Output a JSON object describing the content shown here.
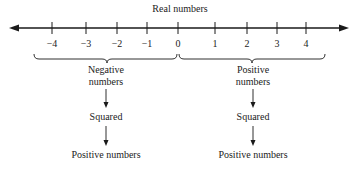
{
  "title": "Real numbers",
  "number_line": {
    "ticks": [
      "-4",
      "-3",
      "-2",
      "-1",
      "0",
      "1",
      "2",
      "3",
      "4"
    ],
    "tick_display": [
      "−4",
      "−3",
      "−2",
      "−1",
      "0",
      "1",
      "2",
      "3",
      "4"
    ]
  },
  "left_branch": {
    "group_label_line1": "Negative",
    "group_label_line2": "numbers",
    "step": "Squared",
    "result": "Positive numbers"
  },
  "right_branch": {
    "group_label_line1": "Positive",
    "group_label_line2": "numbers",
    "step": "Squared",
    "result": "Positive numbers"
  },
  "colors": {
    "line": "#1a1a1a",
    "background": "#ffffff"
  }
}
